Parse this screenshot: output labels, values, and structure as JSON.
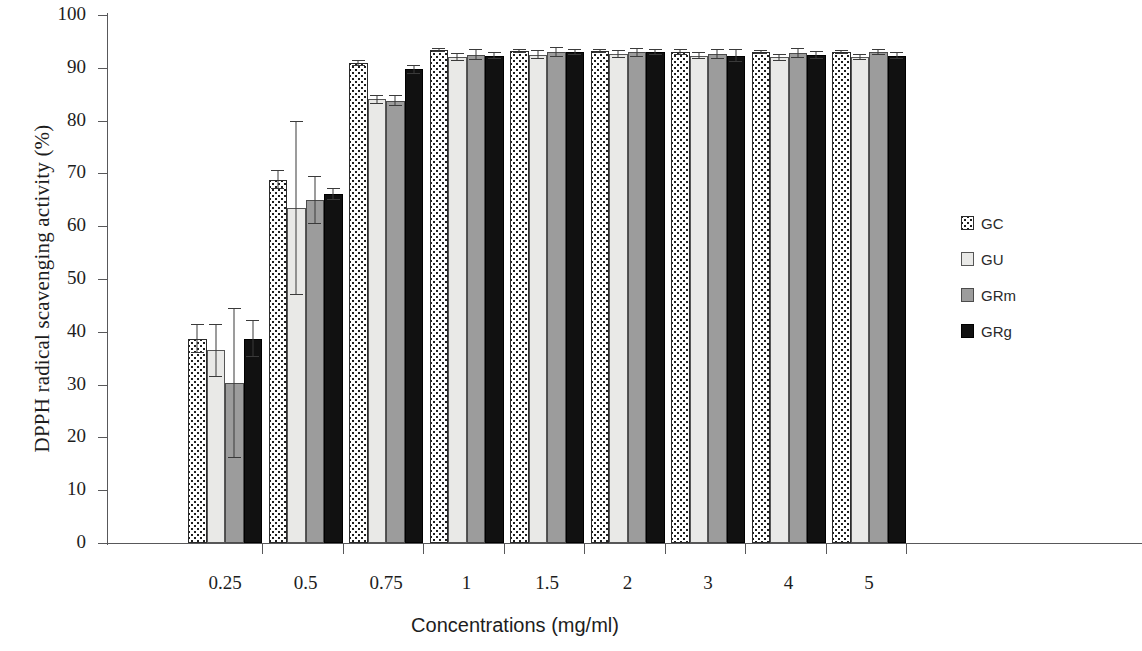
{
  "chart_data": {
    "type": "bar",
    "title": "",
    "xlabel": "Concentrations (mg/ml)",
    "ylabel": "DPPH radical scavenging activity (%)",
    "categories": [
      "0.25",
      "0.5",
      "0.75",
      "1",
      "1.5",
      "2",
      "3",
      "4",
      "5"
    ],
    "ylim": [
      0,
      100
    ],
    "yticks": [
      0,
      10,
      20,
      30,
      40,
      50,
      60,
      70,
      80,
      90,
      100
    ],
    "ytick_labels": [
      "0",
      "10",
      "20",
      "30",
      "40",
      "50",
      "60",
      "70",
      "80",
      "90",
      "100"
    ],
    "grid": false,
    "legend_position": "right",
    "series": [
      {
        "name": "GC",
        "fill": "dotted-pattern",
        "color": "#ffffff",
        "values": [
          38.7,
          68.8,
          90.9,
          93.3,
          93.2,
          93.2,
          93.0,
          93.0,
          93.0
        ],
        "errors": [
          2.8,
          1.8,
          0.5,
          0.4,
          0.4,
          0.4,
          0.5,
          0.4,
          0.4
        ]
      },
      {
        "name": "GU",
        "fill": "solid-light",
        "color": "#e9e9e7",
        "values": [
          36.5,
          63.5,
          84.0,
          92.0,
          92.5,
          92.6,
          92.3,
          92.0,
          92.0
        ],
        "errors": [
          5.0,
          16.5,
          0.8,
          0.8,
          0.8,
          0.7,
          0.7,
          0.7,
          0.6
        ]
      },
      {
        "name": "GRm",
        "fill": "solid-gray",
        "color": "#9c9c9c",
        "values": [
          30.3,
          65.0,
          83.8,
          92.5,
          93.0,
          92.9,
          92.6,
          92.8,
          93.0
        ],
        "errors": [
          14.2,
          4.5,
          1.0,
          1.0,
          0.9,
          0.8,
          1.0,
          0.9,
          0.6
        ]
      },
      {
        "name": "GRg",
        "fill": "solid-black",
        "color": "#111111",
        "values": [
          38.7,
          66.1,
          89.7,
          92.3,
          93.0,
          93.0,
          92.3,
          92.4,
          92.3
        ],
        "errors": [
          3.5,
          1.2,
          0.9,
          0.7,
          0.6,
          0.6,
          1.2,
          0.8,
          0.6
        ]
      }
    ]
  },
  "axes": {
    "y_title": "DPPH radical scavenging activity (%)",
    "x_title": "Concentrations (mg/ml)"
  },
  "legend": {
    "items": [
      {
        "label": "GC",
        "swatch": "dotted-swatch"
      },
      {
        "label": "GU",
        "swatch": "light-swatch"
      },
      {
        "label": "GRm",
        "swatch": "gray-swatch"
      },
      {
        "label": "GRg",
        "swatch": "black-swatch"
      }
    ]
  }
}
